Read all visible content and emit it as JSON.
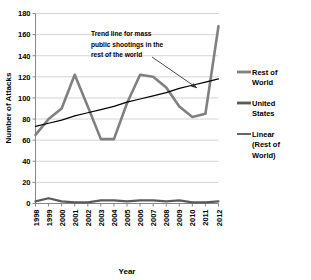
{
  "chart_data": {
    "type": "line",
    "title": "",
    "xlabel": "Year",
    "ylabel": "Number of Attacks",
    "x": [
      1998,
      1999,
      2000,
      2001,
      2002,
      2003,
      2004,
      2005,
      2006,
      2007,
      2008,
      2009,
      2010,
      2011,
      2012
    ],
    "categories": [
      "1998",
      "1999",
      "2000",
      "2001",
      "2002",
      "2003",
      "2004",
      "2005",
      "2006",
      "2007",
      "2008",
      "2009",
      "2010",
      "2011",
      "2012"
    ],
    "xlim": [
      1998,
      2012
    ],
    "ylim": [
      0,
      180
    ],
    "ytick_values": [
      0,
      20,
      40,
      60,
      80,
      100,
      120,
      140,
      160,
      180
    ],
    "ytick_labels": [
      "0",
      "20",
      "40",
      "60",
      "80",
      "100",
      "120",
      "140",
      "160",
      "180"
    ],
    "grid": "horizontal",
    "legend_position": "right",
    "series": [
      {
        "name": "Rest of World",
        "color": "#808080",
        "width": 2.6,
        "values": [
          65,
          80,
          90,
          122,
          92,
          61,
          61,
          95,
          122,
          120,
          110,
          92,
          82,
          85,
          168
        ]
      },
      {
        "name": "United States",
        "color": "#595959",
        "width": 2.2,
        "values": [
          2,
          5,
          2,
          1,
          1,
          3,
          3,
          2,
          3,
          3,
          2,
          3,
          1,
          1,
          2
        ]
      },
      {
        "name": "Linear (Rest of World)",
        "color": "#000000",
        "width": 1.2,
        "trend": true,
        "values": [
          73,
          76,
          79,
          83,
          86,
          89,
          92,
          96,
          99,
          102,
          105,
          109,
          112,
          115,
          118
        ]
      }
    ],
    "annotations": [
      {
        "name": "trend-line-note",
        "lines": [
          "Trend line for mass",
          "public shootings in the",
          "rest of the world"
        ],
        "arrow": {
          "from_x": 152,
          "from_y": 57,
          "to_x": 197,
          "to_y": 88
        }
      }
    ]
  },
  "legend": {
    "items": [
      {
        "label_lines": [
          "Rest of",
          "World"
        ],
        "color": "#808080",
        "swatch": "thick"
      },
      {
        "label_lines": [
          "United",
          "States"
        ],
        "color": "#595959",
        "swatch": "thick"
      },
      {
        "label_lines": [
          "Linear",
          "(Rest of",
          "World)"
        ],
        "color": "#000000",
        "swatch": "thin"
      }
    ]
  }
}
